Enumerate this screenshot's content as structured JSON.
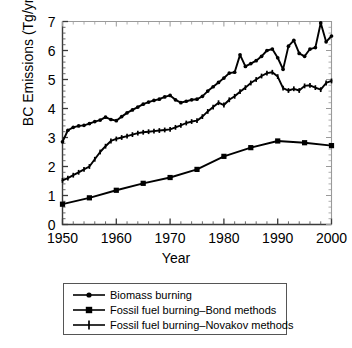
{
  "chart_data": {
    "type": "line",
    "title": "",
    "xlabel": "Year",
    "ylabel": "BC Emissions (Tg/yr)",
    "xlim": [
      1950,
      2000
    ],
    "ylim": [
      0,
      7
    ],
    "xticks": [
      1950,
      1960,
      1970,
      1980,
      1990,
      2000
    ],
    "xtick_labels": [
      "1950",
      "1960",
      "1970",
      "1980",
      "1990",
      "2000"
    ],
    "yticks": [
      0,
      1,
      2,
      3,
      4,
      5,
      6,
      7
    ],
    "ytick_labels": [
      "0",
      "1",
      "2",
      "3",
      "4",
      "5",
      "6",
      "7"
    ],
    "minor_ticks": true,
    "grid": false,
    "legend_position": "below-plot",
    "line_color": "#000000",
    "series": [
      {
        "name": "Biomass burning",
        "marker": "circle",
        "x": [
          1950,
          1951,
          1952,
          1953,
          1954,
          1955,
          1956,
          1957,
          1958,
          1959,
          1960,
          1961,
          1962,
          1963,
          1964,
          1965,
          1966,
          1967,
          1968,
          1969,
          1970,
          1971,
          1972,
          1973,
          1974,
          1975,
          1976,
          1977,
          1978,
          1979,
          1980,
          1981,
          1982,
          1983,
          1984,
          1985,
          1986,
          1987,
          1988,
          1989,
          1990,
          1991,
          1992,
          1993,
          1994,
          1995,
          1996,
          1997,
          1998,
          1999,
          2000
        ],
        "values": [
          2.85,
          3.25,
          3.35,
          3.4,
          3.42,
          3.48,
          3.55,
          3.6,
          3.7,
          3.62,
          3.58,
          3.72,
          3.85,
          3.95,
          4.05,
          4.15,
          4.22,
          4.28,
          4.32,
          4.4,
          4.45,
          4.3,
          4.2,
          4.25,
          4.3,
          4.32,
          4.42,
          4.6,
          4.75,
          4.9,
          5.05,
          5.22,
          5.25,
          5.85,
          5.45,
          5.55,
          5.65,
          5.8,
          6.0,
          6.05,
          5.75,
          5.35,
          6.15,
          6.35,
          5.9,
          5.8,
          6.05,
          6.1,
          6.95,
          6.3,
          6.5
        ]
      },
      {
        "name": "Fossil fuel burning–Bond methods",
        "marker": "square",
        "x": [
          1950,
          1955,
          1960,
          1965,
          1970,
          1975,
          1980,
          1985,
          1990,
          1995,
          2000
        ],
        "values": [
          0.7,
          0.92,
          1.18,
          1.42,
          1.62,
          1.9,
          2.35,
          2.65,
          2.88,
          2.82,
          2.72
        ]
      },
      {
        "name": "Fossil fuel burning–Novakov methods",
        "marker": "plus",
        "x": [
          1950,
          1951,
          1952,
          1953,
          1954,
          1955,
          1956,
          1957,
          1958,
          1959,
          1960,
          1961,
          1962,
          1963,
          1964,
          1965,
          1966,
          1967,
          1968,
          1969,
          1970,
          1971,
          1972,
          1973,
          1974,
          1975,
          1976,
          1977,
          1978,
          1979,
          1980,
          1981,
          1982,
          1983,
          1984,
          1985,
          1986,
          1987,
          1988,
          1989,
          1990,
          1991,
          1992,
          1993,
          1994,
          1995,
          1996,
          1997,
          1998,
          1999,
          2000
        ],
        "values": [
          1.52,
          1.6,
          1.7,
          1.8,
          1.9,
          2.0,
          2.25,
          2.5,
          2.7,
          2.88,
          2.95,
          3.0,
          3.05,
          3.1,
          3.15,
          3.18,
          3.2,
          3.22,
          3.24,
          3.26,
          3.28,
          3.35,
          3.42,
          3.5,
          3.55,
          3.58,
          3.72,
          3.9,
          4.05,
          4.2,
          4.12,
          4.3,
          4.42,
          4.58,
          4.72,
          4.88,
          5.0,
          5.12,
          5.22,
          5.25,
          5.1,
          4.7,
          4.62,
          4.68,
          4.62,
          4.78,
          4.8,
          4.72,
          4.65,
          4.88,
          4.95
        ]
      }
    ]
  },
  "axes": {
    "xlabel": "Year",
    "ylabel": "BC Emissions (Tg/yr)"
  },
  "legend": {
    "items": [
      {
        "label": "Biomass burning",
        "marker": "circle"
      },
      {
        "label": "Fossil fuel burning–Bond methods",
        "marker": "square"
      },
      {
        "label": "Fossil fuel burning–Novakov methods",
        "marker": "plus"
      }
    ]
  }
}
